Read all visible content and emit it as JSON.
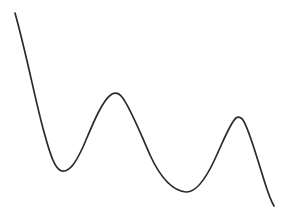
{
  "figure": {
    "title": "",
    "background_color": "#ffffff",
    "width": 290,
    "height": 211
  },
  "curve": {
    "name": "oscillating-curve",
    "stroke_color": "#2b2b2b",
    "stroke_width": 1.7,
    "path": "M 15,13 C 27,56 36,104 44,132 C 50,154 55,170 62,171 C 70,172 76,162 83,147 C 92,126 102,100 112,94 C 115,92.5 119,93 122,97 C 130,107 139,130 150,155 C 162,181 174,191 186,192 C 196,192.5 205,180 214,161 C 223,142 230,123 236,118 C 238,116.5 241,117 243,120 C 249,129 256,155 264,180 C 268,193 271,201 274,206"
  },
  "chart_data": {
    "type": "line",
    "title": "",
    "xlabel": "",
    "ylabel": "",
    "xlim": [
      0,
      290
    ],
    "ylim": [
      211,
      0
    ],
    "grid": false,
    "legend": null,
    "axes_visible": false,
    "tick_labels_x": [],
    "tick_labels_y": [],
    "series": [
      {
        "name": "curve",
        "color": "#2b2b2b",
        "keypoints": [
          {
            "role": "start",
            "x": 15,
            "y": 13
          },
          {
            "role": "minimum",
            "x": 62,
            "y": 171
          },
          {
            "role": "maximum",
            "x": 117,
            "y": 94
          },
          {
            "role": "minimum",
            "x": 186,
            "y": 192
          },
          {
            "role": "maximum",
            "x": 238,
            "y": 117
          },
          {
            "role": "end",
            "x": 274,
            "y": 206
          }
        ],
        "x": [
          15,
          25,
          35,
          44,
          53,
          62,
          72,
          83,
          95,
          106,
          117,
          128,
          139,
          150,
          163,
          175,
          186,
          197,
          208,
          218,
          228,
          238,
          248,
          258,
          266,
          274
        ],
        "y": [
          13,
          52,
          92,
          132,
          158,
          171,
          169,
          147,
          117,
          99,
          94,
          103,
          124,
          155,
          178,
          189,
          192,
          186,
          169,
          148,
          128,
          117,
          135,
          165,
          188,
          206
        ]
      }
    ]
  }
}
